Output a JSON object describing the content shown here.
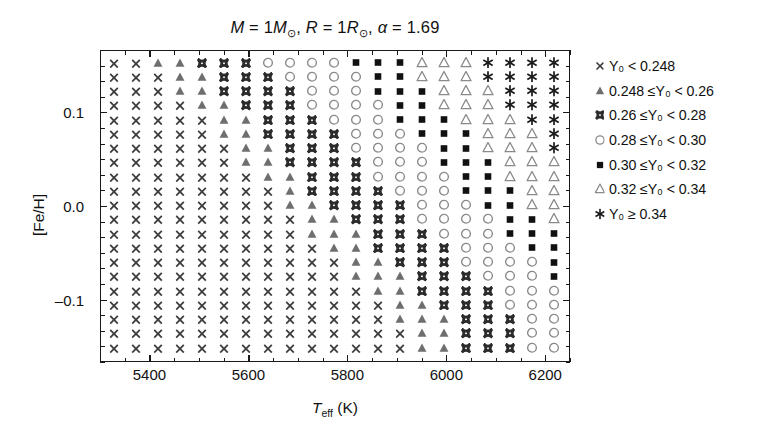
{
  "chart_data": {
    "type": "scatter",
    "title_parts": {
      "mass": "M = 1M",
      "radius": "R = 1R",
      "alpha_symbol": "α",
      "alpha_value": "1.69",
      "sun_symbol": "☉"
    },
    "xlabel": "T_eff (K)",
    "xlabel_parts": {
      "main": "T",
      "sub": "eff",
      "unit": "(K)"
    },
    "ylabel": "[Fe/H]",
    "xlim": [
      5300,
      6250
    ],
    "ylim": [
      -0.1667,
      0.1667
    ],
    "xticks": [
      5400,
      5600,
      5800,
      6000,
      6200
    ],
    "xticklabels": [
      "5400",
      "5600",
      "5800",
      "6000",
      "6200"
    ],
    "xminor_step": 50,
    "yticks": [
      0.1,
      0.0,
      -0.1
    ],
    "yticklabels": [
      "0.1",
      "0.0",
      "–0.1"
    ],
    "yminor_step": 0.0167,
    "grid": false,
    "legend_position": "right-outside",
    "x_values": [
      5350,
      5400,
      5450,
      5500,
      5550,
      5600,
      5650,
      5700,
      5750,
      5800,
      5850,
      5900,
      5950,
      6000,
      6050,
      6100,
      6150,
      6200
    ],
    "y_values": [
      0.15,
      0.1333,
      0.1167,
      0.1,
      0.0833,
      0.0667,
      0.05,
      0.0333,
      0.0167,
      0.0,
      -0.0167,
      -0.0333,
      -0.05,
      -0.0667,
      -0.0833,
      -0.1,
      -0.1167,
      -0.1333,
      -0.15
    ],
    "grid_n_cols": 21,
    "grid_n_rows": 21,
    "legend": [
      {
        "marker": "cross",
        "label": "Y₀ < 0.248",
        "color": "#3d3d3d"
      },
      {
        "marker": "filled-triangle",
        "label": "0.248 ≤Y₀ < 0.26",
        "color": "#6e6e6e"
      },
      {
        "marker": "bowtie",
        "label": "0.26 ≤Y₀ < 0.28",
        "color": "#2b2b2b"
      },
      {
        "marker": "open-circle",
        "label": "0.28 ≤Y₀ < 0.30",
        "color": "#8a8a8a"
      },
      {
        "marker": "filled-square",
        "label": "0.30 ≤Y₀ < 0.32",
        "color": "#111111"
      },
      {
        "marker": "open-triangle",
        "label": "0.32 ≤Y₀ < 0.34",
        "color": "#8a8a8a"
      },
      {
        "marker": "asterisk",
        "label": "Y₀ ≥ 0.34",
        "color": "#1a1a1a"
      }
    ],
    "category_codes": [
      "cross",
      "filled-triangle",
      "bowtie",
      "open-circle",
      "filled-square",
      "open-triangle",
      "asterisk"
    ],
    "grid_categories": [
      [
        0,
        0,
        1,
        1,
        2,
        2,
        2,
        3,
        3,
        3,
        3,
        4,
        4,
        4,
        5,
        5,
        5,
        6,
        6,
        6,
        6
      ],
      [
        0,
        0,
        0,
        1,
        1,
        2,
        2,
        2,
        3,
        3,
        3,
        3,
        4,
        4,
        5,
        5,
        5,
        6,
        6,
        6,
        6
      ],
      [
        0,
        0,
        0,
        1,
        1,
        2,
        2,
        2,
        2,
        3,
        3,
        3,
        4,
        4,
        4,
        5,
        5,
        5,
        6,
        6,
        6
      ],
      [
        0,
        0,
        0,
        0,
        1,
        1,
        2,
        2,
        2,
        3,
        3,
        3,
        3,
        4,
        4,
        5,
        5,
        5,
        6,
        6,
        6
      ],
      [
        0,
        0,
        0,
        0,
        0,
        1,
        1,
        2,
        2,
        2,
        3,
        3,
        3,
        4,
        4,
        4,
        5,
        5,
        5,
        6,
        6
      ],
      [
        0,
        0,
        0,
        0,
        0,
        1,
        1,
        2,
        2,
        2,
        2,
        3,
        3,
        3,
        4,
        4,
        4,
        5,
        5,
        5,
        6
      ],
      [
        0,
        0,
        0,
        0,
        0,
        0,
        1,
        1,
        2,
        2,
        2,
        3,
        3,
        3,
        3,
        4,
        4,
        5,
        5,
        5,
        6
      ],
      [
        0,
        0,
        0,
        0,
        0,
        0,
        1,
        1,
        2,
        2,
        2,
        2,
        3,
        3,
        3,
        4,
        4,
        4,
        5,
        5,
        5
      ],
      [
        0,
        0,
        0,
        0,
        0,
        0,
        0,
        1,
        1,
        2,
        2,
        2,
        3,
        3,
        3,
        3,
        4,
        4,
        5,
        5,
        5
      ],
      [
        0,
        0,
        0,
        0,
        0,
        0,
        0,
        0,
        1,
        2,
        2,
        2,
        2,
        3,
        3,
        3,
        4,
        4,
        4,
        5,
        5
      ],
      [
        0,
        0,
        0,
        0,
        0,
        0,
        0,
        0,
        1,
        1,
        2,
        2,
        2,
        2,
        3,
        3,
        3,
        4,
        4,
        5,
        5
      ],
      [
        0,
        0,
        0,
        0,
        0,
        0,
        0,
        0,
        0,
        1,
        1,
        2,
        2,
        2,
        3,
        3,
        3,
        3,
        4,
        4,
        5
      ],
      [
        0,
        0,
        0,
        0,
        0,
        0,
        0,
        0,
        0,
        1,
        1,
        1,
        2,
        2,
        2,
        3,
        3,
        3,
        4,
        4,
        4
      ],
      [
        0,
        0,
        0,
        0,
        0,
        0,
        0,
        0,
        0,
        0,
        1,
        1,
        2,
        2,
        2,
        2,
        3,
        3,
        3,
        4,
        4
      ],
      [
        0,
        0,
        0,
        0,
        0,
        0,
        0,
        0,
        0,
        0,
        0,
        1,
        1,
        2,
        2,
        2,
        3,
        3,
        3,
        3,
        4
      ],
      [
        0,
        0,
        0,
        0,
        0,
        0,
        0,
        0,
        0,
        0,
        0,
        1,
        1,
        1,
        2,
        2,
        2,
        3,
        3,
        3,
        4
      ],
      [
        0,
        0,
        0,
        0,
        0,
        0,
        0,
        0,
        0,
        0,
        0,
        0,
        1,
        1,
        2,
        2,
        2,
        2,
        3,
        3,
        3
      ],
      [
        0,
        0,
        0,
        0,
        0,
        0,
        0,
        0,
        0,
        0,
        0,
        0,
        0,
        1,
        1,
        2,
        2,
        2,
        3,
        3,
        3
      ],
      [
        0,
        0,
        0,
        0,
        0,
        0,
        0,
        0,
        0,
        0,
        0,
        0,
        0,
        1,
        1,
        1,
        2,
        2,
        2,
        3,
        3
      ],
      [
        0,
        0,
        0,
        0,
        0,
        0,
        0,
        0,
        0,
        0,
        0,
        0,
        0,
        0,
        1,
        1,
        2,
        2,
        2,
        3,
        3
      ],
      [
        0,
        0,
        0,
        0,
        0,
        0,
        0,
        0,
        0,
        0,
        0,
        0,
        0,
        0,
        1,
        1,
        2,
        2,
        2,
        3,
        3
      ]
    ]
  }
}
